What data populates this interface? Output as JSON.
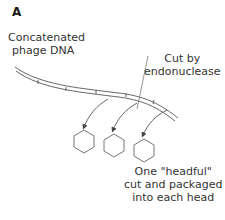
{
  "panel": {
    "label": "A"
  },
  "labels": {
    "concatenated_line1": "Concatenated",
    "concatenated_line2": "phage DNA",
    "cut_line1": "Cut by",
    "cut_line2": "endonuclease",
    "headful_line1": "One \"headful\"",
    "headful_line2": "cut and packaged",
    "headful_line3": "into each head"
  },
  "diagram": {
    "elements": [
      "concatenated DNA double strand with segment ticks",
      "three curved arrows",
      "three hexagonal phage heads"
    ],
    "stroke_color": "#555555"
  }
}
